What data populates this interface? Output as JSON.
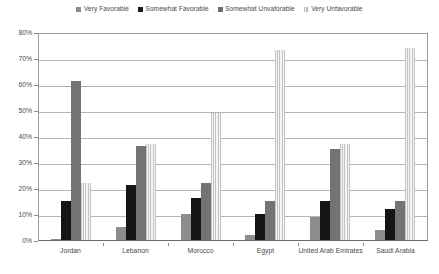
{
  "chart_data": {
    "type": "bar",
    "title": "",
    "subtitle": "",
    "xlabel": "",
    "ylabel": "",
    "ylim": [
      0,
      80
    ],
    "ytick_values": [
      0,
      10,
      20,
      30,
      40,
      50,
      60,
      70,
      80
    ],
    "ytick_labels": [
      "0%",
      "10%",
      "20%",
      "30%",
      "40%",
      "50%",
      "60%",
      "70%",
      "80%"
    ],
    "grid": true,
    "legend_position": "top-center",
    "categories": [
      "Jordan",
      "Lebanon",
      "Morocco",
      "Egypt",
      "United Arab Emirates",
      "Saudi Arabia"
    ],
    "series": [
      {
        "name": "Very Favorable",
        "color": "#8d8d8d",
        "values": [
          0.5,
          5,
          10,
          2,
          9,
          4
        ]
      },
      {
        "name": "Somewhat Favorable",
        "color": "#151515",
        "values": [
          15,
          21,
          16,
          10,
          15,
          12
        ]
      },
      {
        "name": "Somewhat Unvaforable",
        "color": "#737373",
        "values": [
          61,
          36,
          22,
          15,
          35,
          15
        ]
      },
      {
        "name": "Very Unfavorable",
        "color": "#c4c4c4",
        "values": [
          22,
          37,
          49,
          73,
          37,
          74
        ]
      }
    ]
  },
  "legend": {
    "items": [
      {
        "label": "Very Favorable",
        "swatch": "solid-gray-swatch"
      },
      {
        "label": "Somewhat Favorable",
        "swatch": "solid-black-swatch"
      },
      {
        "label": "Somewhat Unvaforable",
        "swatch": "solid-dark-gray-swatch"
      },
      {
        "label": "Very Unfavorable",
        "swatch": "striped-light-swatch"
      }
    ]
  }
}
